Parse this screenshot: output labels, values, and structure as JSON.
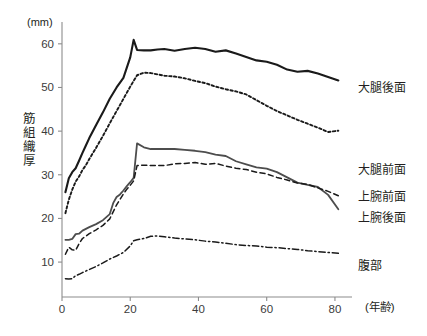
{
  "chart_data": {
    "type": "line",
    "title": "",
    "subtitle": "",
    "xlabel": "(年齢)",
    "ylabel": "筋組織厚",
    "yunit": "(mm)",
    "xlim": [
      0,
      85
    ],
    "ylim": [
      2,
      65
    ],
    "xticks": [
      0,
      20,
      40,
      60,
      80
    ],
    "yticks": [
      10,
      20,
      30,
      40,
      50,
      60
    ],
    "xtick_labels": [
      "0",
      "20",
      "40",
      "60",
      "80"
    ],
    "ytick_labels": [
      "10",
      "20",
      "30",
      "40",
      "50",
      "60"
    ],
    "grid": false,
    "legend_position": "right-inline",
    "series": [
      {
        "name": "大腿後面",
        "label": "大腿後面",
        "style": "solid",
        "color": "#1a1a1a",
        "width": 2.1,
        "x": [
          1,
          2,
          3,
          4,
          5,
          6,
          7,
          8,
          10,
          12,
          14,
          16,
          18,
          20,
          21,
          22,
          24,
          26,
          28,
          30,
          33,
          36,
          39,
          42,
          45,
          48,
          51,
          54,
          57,
          60,
          63,
          66,
          69,
          72,
          75,
          78,
          81
        ],
        "y": [
          26.0,
          29.2,
          30.6,
          31.5,
          33.2,
          35.0,
          36.7,
          38.4,
          41.4,
          44.3,
          47.4,
          50.0,
          52.2,
          56.9,
          60.9,
          58.6,
          58.5,
          58.5,
          58.7,
          58.8,
          58.4,
          58.8,
          59.1,
          58.8,
          58.2,
          58.5,
          57.8,
          57.0,
          56.2,
          55.9,
          55.2,
          54.1,
          53.6,
          53.8,
          53.2,
          52.4,
          51.6
        ]
      },
      {
        "name": "大腿前面",
        "label": "大腿前面",
        "style": "dotted",
        "color": "#1a1a1a",
        "width": 1.9,
        "x": [
          1,
          2,
          3,
          4,
          5,
          6,
          7,
          8,
          10,
          12,
          14,
          16,
          18,
          20,
          22,
          24,
          26,
          28,
          30,
          33,
          36,
          39,
          42,
          45,
          48,
          51,
          54,
          57,
          60,
          63,
          66,
          69,
          72,
          75,
          78,
          81
        ],
        "y": [
          21.2,
          24.3,
          26.6,
          28.4,
          29.6,
          31.1,
          32.2,
          33.6,
          36.2,
          38.9,
          41.8,
          44.6,
          47.4,
          50.2,
          52.8,
          53.4,
          53.3,
          53.0,
          52.7,
          52.5,
          52.1,
          51.5,
          51.0,
          50.2,
          49.6,
          49.1,
          48.4,
          47.1,
          45.8,
          44.6,
          43.6,
          42.6,
          41.7,
          40.8,
          39.8,
          40.1
        ]
      },
      {
        "name": "上腕後面",
        "label": "上腕後面",
        "style": "solid",
        "color": "#4d4d4d",
        "width": 1.8,
        "x": [
          1,
          2,
          3,
          4,
          5,
          6,
          8,
          10,
          12,
          14,
          15,
          16,
          17,
          18,
          19,
          20,
          21,
          22,
          24,
          26,
          28,
          30,
          33,
          36,
          39,
          42,
          45,
          48,
          51,
          54,
          57,
          60,
          63,
          66,
          69,
          72,
          75,
          78,
          81
        ],
        "y": [
          15.1,
          15.1,
          15.3,
          16.4,
          16.5,
          17.2,
          18.0,
          18.7,
          19.6,
          21.0,
          23.5,
          24.9,
          25.5,
          26.4,
          27.4,
          28.3,
          29.3,
          37.2,
          36.3,
          35.9,
          35.9,
          35.9,
          35.9,
          35.7,
          35.5,
          35.2,
          34.6,
          34.3,
          33.1,
          32.4,
          31.7,
          31.4,
          30.6,
          29.4,
          28.2,
          27.7,
          27.2,
          25.4,
          22.1
        ]
      },
      {
        "name": "上腕前面",
        "label": "上腕前面",
        "style": "dashed",
        "color": "#1a1a1a",
        "width": 1.5,
        "x": [
          1,
          2,
          3,
          4,
          5,
          6,
          8,
          10,
          12,
          14,
          16,
          18,
          19,
          20,
          21,
          22,
          24,
          26,
          28,
          30,
          33,
          36,
          39,
          42,
          45,
          48,
          51,
          54,
          57,
          60,
          63,
          66,
          69,
          72,
          75,
          78,
          81
        ],
        "y": [
          11.8,
          13.4,
          12.8,
          12.7,
          14.2,
          15.4,
          16.5,
          17.4,
          18.4,
          19.9,
          23.1,
          25.6,
          26.7,
          27.6,
          28.6,
          32.1,
          32.2,
          32.1,
          32.1,
          32.1,
          32.5,
          32.6,
          32.8,
          32.4,
          32.6,
          32.0,
          31.5,
          31.2,
          30.6,
          30.2,
          29.4,
          28.8,
          28.1,
          27.8,
          27.0,
          26.2,
          25.2
        ]
      },
      {
        "name": "腹部",
        "label": "腹部",
        "style": "dashdot",
        "color": "#1a1a1a",
        "width": 1.5,
        "x": [
          1,
          2,
          3,
          4,
          5,
          6,
          8,
          10,
          12,
          14,
          16,
          18,
          20,
          21,
          22,
          24,
          26,
          28,
          30,
          33,
          36,
          39,
          42,
          45,
          48,
          51,
          54,
          57,
          60,
          63,
          66,
          69,
          72,
          75,
          78,
          81
        ],
        "y": [
          6.2,
          6.1,
          6.2,
          6.9,
          7.2,
          7.6,
          8.3,
          9.0,
          9.8,
          10.7,
          11.4,
          12.2,
          13.7,
          14.9,
          15.1,
          15.4,
          15.9,
          16.0,
          15.8,
          15.5,
          15.3,
          15.1,
          14.8,
          14.6,
          14.3,
          14.0,
          13.8,
          13.7,
          13.4,
          13.3,
          13.1,
          12.9,
          12.6,
          12.4,
          12.2,
          12.0
        ]
      }
    ],
    "legend_entries": [
      {
        "label": "大腿後面",
        "style": "solid",
        "color": "#1a1a1a"
      },
      {
        "label": "大腿前面",
        "style": "dotted",
        "color": "#1a1a1a"
      },
      {
        "label": "上腕前面",
        "style": "dashed",
        "color": "#1a1a1a"
      },
      {
        "label": "上腕後面",
        "style": "solid",
        "color": "#4d4d4d"
      },
      {
        "label": "腹部",
        "style": "dashdot",
        "color": "#1a1a1a"
      }
    ]
  },
  "labels": {
    "y_axis_title_chars": [
      "筋",
      "組",
      "織",
      "厚"
    ],
    "y_unit": "(mm)",
    "x_axis_title": "(年齢)",
    "leg_thigh_posterior": "大腿後面",
    "leg_thigh_anterior": "大腿前面",
    "arm_anterior": "上腕前面",
    "arm_posterior": "上腕後面",
    "abdomen": "腹部",
    "ytick_10": "10",
    "ytick_20": "20",
    "ytick_30": "30",
    "ytick_40": "40",
    "ytick_50": "50",
    "ytick_60": "60",
    "xtick_0": "0",
    "xtick_20": "20",
    "xtick_40": "40",
    "xtick_60": "60",
    "xtick_80": "80"
  }
}
